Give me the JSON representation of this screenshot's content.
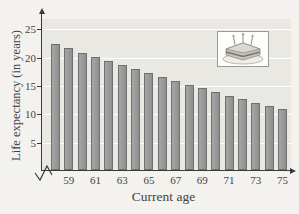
{
  "chart_data": {
    "type": "bar",
    "title": "",
    "xlabel": "Current age",
    "ylabel": "Life expectancy (in years)",
    "categories": [
      58,
      59,
      60,
      61,
      62,
      63,
      64,
      65,
      66,
      67,
      68,
      69,
      70,
      71,
      72,
      73,
      74,
      75
    ],
    "values": [
      22.2,
      21.5,
      20.7,
      20.0,
      19.3,
      18.6,
      17.9,
      17.2,
      16.4,
      15.7,
      15.0,
      14.4,
      13.8,
      13.1,
      12.5,
      11.9,
      11.3,
      10.8
    ],
    "x_tick_labels": [
      "59",
      "61",
      "63",
      "65",
      "67",
      "69",
      "71",
      "73",
      "75"
    ],
    "y_ticks": [
      5,
      10,
      15,
      20,
      25
    ],
    "ylim": [
      0,
      27
    ],
    "grid": "horizontal white lines at each y tick",
    "legend": "none",
    "x_axis_break": true,
    "colors": {
      "bar_fill": "#9a9a9a",
      "bar_border": "#6f6f6f",
      "plot_background": "#e9e8e2",
      "page_background": "#f3f2ee",
      "axis": "#3a3a3a",
      "text": "#44423f",
      "gridline": "#ffffff"
    },
    "inset_icon": "birthday-cake-icon"
  }
}
